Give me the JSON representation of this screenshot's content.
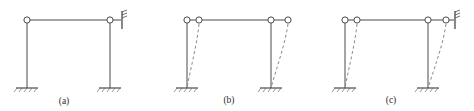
{
  "figure": {
    "type": "engineering-line-diagram",
    "panels": [
      {
        "id": "a",
        "caption": "(a)",
        "caption_x": 64,
        "caption_y": 104,
        "origin_x": 0,
        "beam_y": 20,
        "base_y": 88,
        "left_col_x": 27,
        "right_col_x": 110,
        "hinges": [
          {
            "name": "left-joint-hinge",
            "cx": 27,
            "cy": 20,
            "r": 3.1
          },
          {
            "name": "right-joint-hinge",
            "cx": 110,
            "cy": 20,
            "r": 3.1
          }
        ],
        "supports": [
          {
            "name": "left-fixed-support",
            "cx": 27,
            "cy": 88,
            "width": 22
          },
          {
            "name": "right-fixed-support",
            "cx": 110,
            "cy": 88,
            "width": 22
          }
        ],
        "spring_support": {
          "present": true,
          "x": 122,
          "y": 20,
          "height": 17
        },
        "deformed_shape": false,
        "displaced_hinges": []
      },
      {
        "id": "b",
        "caption": "(b)",
        "caption_x": 229,
        "caption_y": 103,
        "origin_x": 155,
        "beam_y": 20,
        "base_y": 88,
        "left_col_x": 187,
        "right_col_x": 271,
        "hinges": [
          {
            "name": "left-joint-hinge",
            "cx": 187,
            "cy": 20,
            "r": 3.1
          },
          {
            "name": "right-joint-hinge",
            "cx": 271,
            "cy": 20,
            "r": 3.1
          }
        ],
        "displaced_hinges": [
          {
            "name": "left-displaced-hinge",
            "cx": 199,
            "cy": 20,
            "r": 3.1
          },
          {
            "name": "right-displaced-hinge",
            "cx": 288,
            "cy": 20,
            "r": 3.1
          }
        ],
        "supports": [
          {
            "name": "left-fixed-support",
            "cx": 187,
            "cy": 88,
            "width": 22
          },
          {
            "name": "right-fixed-support",
            "cx": 271,
            "cy": 88,
            "width": 22
          }
        ],
        "spring_support": {
          "present": false
        },
        "deformed_shape": true,
        "deformed_curves": [
          {
            "name": "left-column-deformed",
            "top_x": 199,
            "bottom_x": 187
          },
          {
            "name": "right-column-deformed",
            "top_x": 288,
            "bottom_x": 271
          }
        ]
      },
      {
        "id": "c",
        "caption": "(c)",
        "caption_x": 391,
        "caption_y": 103,
        "origin_x": 310,
        "beam_y": 20,
        "base_y": 88,
        "left_col_x": 345,
        "right_col_x": 428,
        "hinges": [
          {
            "name": "left-joint-hinge",
            "cx": 345,
            "cy": 20,
            "r": 3.1
          },
          {
            "name": "right-joint-hinge",
            "cx": 428,
            "cy": 20,
            "r": 3.1
          }
        ],
        "displaced_hinges": [
          {
            "name": "left-displaced-hinge",
            "cx": 357,
            "cy": 20,
            "r": 3.1
          },
          {
            "name": "right-displaced-hinge",
            "cx": 446,
            "cy": 20,
            "r": 3.1
          }
        ],
        "supports": [
          {
            "name": "left-fixed-support",
            "cx": 345,
            "cy": 88,
            "width": 22
          },
          {
            "name": "right-fixed-support",
            "cx": 428,
            "cy": 88,
            "width": 22
          }
        ],
        "spring_support": {
          "present": true,
          "x": 455,
          "y": 20,
          "height": 17
        },
        "deformed_shape": true,
        "deformed_curves": [
          {
            "name": "left-column-deformed",
            "top_x": 357,
            "bottom_x": 345
          },
          {
            "name": "right-column-deformed",
            "top_x": 446,
            "bottom_x": 428
          }
        ]
      }
    ],
    "colors": {
      "line": "#4a4a4a",
      "dashed": "#8a8a8a",
      "caption": "#2b2b2b",
      "background": "#ffffff"
    }
  }
}
